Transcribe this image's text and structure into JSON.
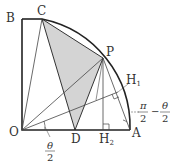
{
  "diagram": {
    "points": {
      "O": {
        "label": "O"
      },
      "A": {
        "label": "A"
      },
      "B": {
        "label": "B"
      },
      "C": {
        "label": "C"
      },
      "P": {
        "label": "P"
      },
      "D": {
        "label": "D"
      },
      "H1": {
        "label": "H",
        "sub": "1"
      },
      "H2": {
        "label": "H",
        "sub": "2"
      }
    },
    "angle_labels": {
      "theta_half": {
        "num": "θ",
        "den": "2"
      },
      "pi_minus": {
        "num1": "π",
        "den1": "2",
        "op": "−",
        "num2": "θ",
        "den2": "2"
      }
    },
    "colors": {
      "shade": "#d4d4d4",
      "line": "#333333"
    }
  }
}
